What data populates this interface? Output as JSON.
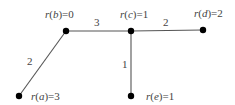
{
  "diagram": {
    "nodes": [
      {
        "id": "b",
        "label_var": "b",
        "label": "r(b)=0",
        "value": "0",
        "x": 66,
        "y": 31,
        "lx": 48,
        "ly": 18
      },
      {
        "id": "c",
        "label_var": "c",
        "label": "r(c)=1",
        "value": "1",
        "x": 131,
        "y": 31,
        "lx": 122,
        "ly": 18
      },
      {
        "id": "d",
        "label_var": "d",
        "label": "r(d)=2",
        "value": "2",
        "x": 203,
        "y": 30,
        "lx": 196,
        "ly": 17
      },
      {
        "id": "a",
        "label_var": "a",
        "label": "r(a)=3",
        "value": "3",
        "x": 19,
        "y": 96,
        "lx": 31,
        "ly": 100
      },
      {
        "id": "e",
        "label_var": "e",
        "label": "r(e)=1",
        "value": "1",
        "x": 131,
        "y": 96,
        "lx": 145,
        "ly": 100
      }
    ],
    "edges": [
      {
        "from": "b",
        "to": "c",
        "weight": "3",
        "wx": 97,
        "wy": 26
      },
      {
        "from": "c",
        "to": "d",
        "weight": "2",
        "wx": 165,
        "wy": 26
      },
      {
        "from": "b",
        "to": "a",
        "weight": "2",
        "wx": 28,
        "wy": 64
      },
      {
        "from": "c",
        "to": "e",
        "weight": "1",
        "wx": 123,
        "wy": 67
      }
    ]
  }
}
